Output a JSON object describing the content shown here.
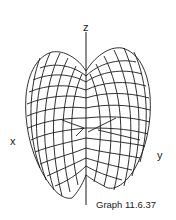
{
  "figure": {
    "caption": "Graph 11.6.37",
    "axes": {
      "z": "z",
      "x": "x",
      "y": "y"
    }
  }
}
